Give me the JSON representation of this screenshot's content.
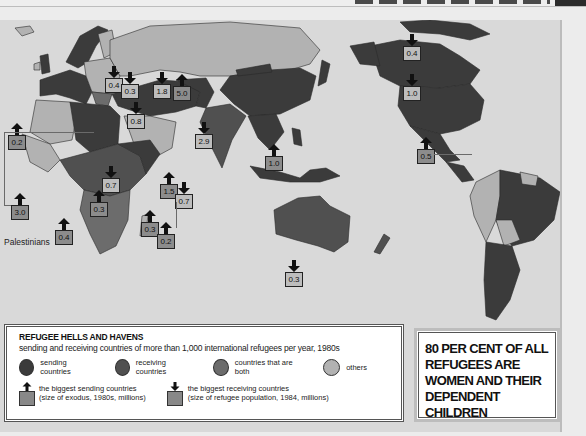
{
  "colors": {
    "sending": "#3b3b3b",
    "receiving": "#505050",
    "both": "#6c6c6c",
    "others": "#b2b2b2",
    "sea": "#d9d9d9"
  },
  "markers": [
    {
      "id": "western-sahara",
      "type": "sending",
      "value": "0.2"
    },
    {
      "id": "palestinians",
      "type": "sending",
      "value": "3.0",
      "label": "Palestinians"
    },
    {
      "id": "angola",
      "type": "sending",
      "value": "0.4"
    },
    {
      "id": "zaire",
      "type": "sending",
      "value": "0.3"
    },
    {
      "id": "sudan",
      "type": "receiving",
      "value": "0.7"
    },
    {
      "id": "uganda",
      "type": "sending",
      "value": "0.3"
    },
    {
      "id": "mozambique",
      "type": "sending",
      "value": "0.2"
    },
    {
      "id": "ethiopia",
      "type": "sending",
      "value": "1.5"
    },
    {
      "id": "somalia",
      "type": "receiving",
      "value": "0.7"
    },
    {
      "id": "germany",
      "type": "receiving",
      "value": "0.4"
    },
    {
      "id": "turkey",
      "type": "receiving",
      "value": "0.3"
    },
    {
      "id": "saudi-arabia",
      "type": "receiving",
      "value": "0.8"
    },
    {
      "id": "iran",
      "type": "receiving",
      "value": "1.8"
    },
    {
      "id": "afghanistan",
      "type": "sending",
      "value": "5.0"
    },
    {
      "id": "pakistan",
      "type": "receiving",
      "value": "2.9"
    },
    {
      "id": "vietnam",
      "type": "sending",
      "value": "1.0"
    },
    {
      "id": "australia",
      "type": "receiving",
      "value": "0.3"
    },
    {
      "id": "canada",
      "type": "receiving",
      "value": "0.4"
    },
    {
      "id": "usa",
      "type": "receiving",
      "value": "1.0"
    },
    {
      "id": "central-america",
      "type": "sending",
      "value": "0.5"
    }
  ],
  "legend": {
    "title": "REFUGEE HELLS AND HAVENS",
    "subtitle": "sending and receiving countries of more than 1,000 international refugees per year, 1980s",
    "categories": [
      {
        "key": "sending",
        "label": "sending countries"
      },
      {
        "key": "receiving",
        "label": "receiving countries"
      },
      {
        "key": "both",
        "label": "countries that are both"
      },
      {
        "key": "others",
        "label": "others"
      }
    ],
    "biggest_sending": {
      "line1": "the biggest sending countries",
      "line2": "(size of exodus, 1980s, millions)"
    },
    "biggest_receiving": {
      "line1": "the biggest receiving countries",
      "line2": "(size of refugee population, 1984, millions)"
    }
  },
  "callout": {
    "text": "80 PER CENT OF ALL REFUGEES ARE WOMEN AND THEIR DEPENDENT CHILDREN"
  }
}
